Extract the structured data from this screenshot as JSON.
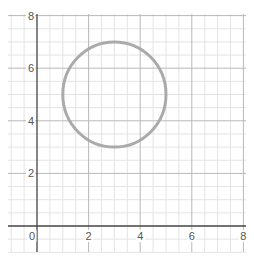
{
  "chart_data": {
    "type": "scatter",
    "title": "",
    "xlabel": "",
    "ylabel": "",
    "xlim": [
      -1.25,
      8
    ],
    "ylim": [
      -1,
      8.3
    ],
    "grid": true,
    "grid_minor_step": 0.5,
    "grid_major_step": 2,
    "x_ticks": [
      "0",
      "2",
      "4",
      "6",
      "8"
    ],
    "y_ticks": [
      "2",
      "4",
      "6",
      "8"
    ],
    "shapes": [
      {
        "kind": "circle",
        "center": [
          3,
          5
        ],
        "radius": 2,
        "stroke": "#aaaaaa"
      }
    ],
    "colors": {
      "minor_grid": "#e4e4e4",
      "major_grid": "#b8b8b8",
      "axis": "#444444",
      "circle": "#aaaaaa"
    }
  }
}
